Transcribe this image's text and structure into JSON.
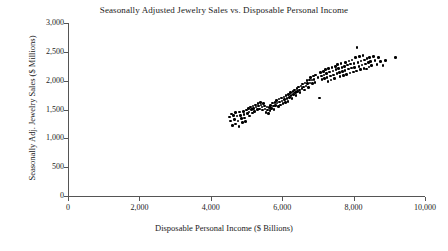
{
  "chart_data": {
    "type": "scatter",
    "title": "Seasonally Adjusted Jewelry Sales vs. Disposable Personal Income",
    "xlabel": "Disposable Personal Income ($ Billions)",
    "ylabel": "Seasonally Adj. Jewelry Sales ($ Millions)",
    "xlim": [
      0,
      10000
    ],
    "ylim": [
      0,
      3000
    ],
    "xticks": [
      0,
      2000,
      4000,
      6000,
      8000,
      10000
    ],
    "yticks": [
      0,
      500,
      1000,
      1500,
      2000,
      2500,
      3000
    ],
    "xticklabels": [
      "0",
      "2,000",
      "4,000",
      "6,000",
      "8,000",
      "10,000"
    ],
    "yticklabels": [
      "0",
      "500",
      "1,000",
      "1,500",
      "2,000",
      "2,500",
      "3,000"
    ],
    "grid": false,
    "legend": false,
    "marker": {
      "color": "#000000",
      "size": 2.6,
      "shape": "circle"
    },
    "points": [
      [
        4520,
        1370
      ],
      [
        4560,
        1300
      ],
      [
        4580,
        1420
      ],
      [
        4600,
        1225
      ],
      [
        4640,
        1400
      ],
      [
        4660,
        1330
      ],
      [
        4690,
        1250
      ],
      [
        4700,
        1445
      ],
      [
        4730,
        1390
      ],
      [
        4760,
        1300
      ],
      [
        4790,
        1210
      ],
      [
        4810,
        1455
      ],
      [
        4840,
        1400
      ],
      [
        4860,
        1340
      ],
      [
        4880,
        1270
      ],
      [
        4910,
        1470
      ],
      [
        4930,
        1410
      ],
      [
        4950,
        1350
      ],
      [
        4980,
        1290
      ],
      [
        5000,
        1490
      ],
      [
        5020,
        1430
      ],
      [
        5050,
        1520
      ],
      [
        5070,
        1460
      ],
      [
        5090,
        1390
      ],
      [
        5110,
        1540
      ],
      [
        5140,
        1500
      ],
      [
        5160,
        1440
      ],
      [
        5180,
        1560
      ],
      [
        5200,
        1520
      ],
      [
        5230,
        1470
      ],
      [
        5250,
        1580
      ],
      [
        5270,
        1540
      ],
      [
        5300,
        1500
      ],
      [
        5320,
        1600
      ],
      [
        5340,
        1560
      ],
      [
        5360,
        1510
      ],
      [
        5390,
        1620
      ],
      [
        5410,
        1580
      ],
      [
        5430,
        1540
      ],
      [
        5450,
        1490
      ],
      [
        5480,
        1600
      ],
      [
        5500,
        1560
      ],
      [
        5520,
        1510
      ],
      [
        5550,
        1450
      ],
      [
        5570,
        1540
      ],
      [
        5590,
        1490
      ],
      [
        5610,
        1430
      ],
      [
        5640,
        1530
      ],
      [
        5660,
        1480
      ],
      [
        5680,
        1570
      ],
      [
        5700,
        1520
      ],
      [
        5730,
        1610
      ],
      [
        5750,
        1560
      ],
      [
        5770,
        1500
      ],
      [
        5800,
        1620
      ],
      [
        5820,
        1570
      ],
      [
        5840,
        1660
      ],
      [
        5860,
        1610
      ],
      [
        5890,
        1550
      ],
      [
        5910,
        1680
      ],
      [
        5930,
        1630
      ],
      [
        5960,
        1580
      ],
      [
        5980,
        1700
      ],
      [
        6000,
        1650
      ],
      [
        6020,
        1600
      ],
      [
        6050,
        1720
      ],
      [
        6070,
        1670
      ],
      [
        6090,
        1620
      ],
      [
        6110,
        1740
      ],
      [
        6140,
        1690
      ],
      [
        6160,
        1640
      ],
      [
        6180,
        1760
      ],
      [
        6200,
        1710
      ],
      [
        6230,
        1790
      ],
      [
        6250,
        1740
      ],
      [
        6270,
        1690
      ],
      [
        6300,
        1810
      ],
      [
        6320,
        1760
      ],
      [
        6340,
        1840
      ],
      [
        6370,
        1790
      ],
      [
        6390,
        1740
      ],
      [
        6410,
        1860
      ],
      [
        6430,
        1810
      ],
      [
        6460,
        1890
      ],
      [
        6480,
        1840
      ],
      [
        6500,
        1790
      ],
      [
        6530,
        1910
      ],
      [
        6550,
        1860
      ],
      [
        6570,
        1940
      ],
      [
        6600,
        1890
      ],
      [
        6620,
        1840
      ],
      [
        6640,
        1960
      ],
      [
        6670,
        1910
      ],
      [
        6690,
        2000
      ],
      [
        6710,
        1950
      ],
      [
        6730,
        1880
      ],
      [
        6760,
        2010
      ],
      [
        6780,
        1960
      ],
      [
        6800,
        2060
      ],
      [
        6830,
        2010
      ],
      [
        6850,
        1950
      ],
      [
        6870,
        2080
      ],
      [
        6890,
        2020
      ],
      [
        6920,
        1970
      ],
      [
        6940,
        2100
      ],
      [
        7000,
        2050
      ],
      [
        7040,
        1700
      ],
      [
        7080,
        2140
      ],
      [
        7100,
        2080
      ],
      [
        7120,
        2020
      ],
      [
        7150,
        2160
      ],
      [
        7170,
        2100
      ],
      [
        7190,
        2040
      ],
      [
        7210,
        2190
      ],
      [
        7240,
        2120
      ],
      [
        7260,
        2060
      ],
      [
        7280,
        1990
      ],
      [
        7300,
        2210
      ],
      [
        7330,
        2150
      ],
      [
        7350,
        2080
      ],
      [
        7370,
        2010
      ],
      [
        7400,
        2230
      ],
      [
        7420,
        2170
      ],
      [
        7440,
        2100
      ],
      [
        7460,
        2040
      ],
      [
        7490,
        2250
      ],
      [
        7510,
        2190
      ],
      [
        7530,
        2120
      ],
      [
        7550,
        2280
      ],
      [
        7580,
        2210
      ],
      [
        7600,
        2140
      ],
      [
        7620,
        2070
      ],
      [
        7650,
        2300
      ],
      [
        7670,
        2230
      ],
      [
        7690,
        2160
      ],
      [
        7710,
        2090
      ],
      [
        7740,
        2250
      ],
      [
        7760,
        2180
      ],
      [
        7780,
        2320
      ],
      [
        7800,
        2110
      ],
      [
        7830,
        2270
      ],
      [
        7850,
        2200
      ],
      [
        7870,
        2340
      ],
      [
        7900,
        2130
      ],
      [
        7920,
        2290
      ],
      [
        7940,
        2220
      ],
      [
        7960,
        2360
      ],
      [
        7990,
        2150
      ],
      [
        8010,
        2300
      ],
      [
        8030,
        2230
      ],
      [
        8060,
        2400
      ],
      [
        8080,
        2170
      ],
      [
        8100,
        2580
      ],
      [
        8120,
        2320
      ],
      [
        8150,
        2250
      ],
      [
        8170,
        2420
      ],
      [
        8190,
        2190
      ],
      [
        8210,
        2340
      ],
      [
        8240,
        2270
      ],
      [
        8260,
        2440
      ],
      [
        8290,
        2210
      ],
      [
        8310,
        2360
      ],
      [
        8330,
        2290
      ],
      [
        8360,
        2200
      ],
      [
        8380,
        2380
      ],
      [
        8410,
        2310
      ],
      [
        8430,
        2240
      ],
      [
        8450,
        2400
      ],
      [
        8480,
        2330
      ],
      [
        8500,
        2260
      ],
      [
        8560,
        2420
      ],
      [
        8600,
        2350
      ],
      [
        8650,
        2280
      ],
      [
        8700,
        2400
      ],
      [
        8760,
        2330
      ],
      [
        8820,
        2260
      ],
      [
        8900,
        2350
      ],
      [
        9180,
        2400
      ]
    ]
  }
}
